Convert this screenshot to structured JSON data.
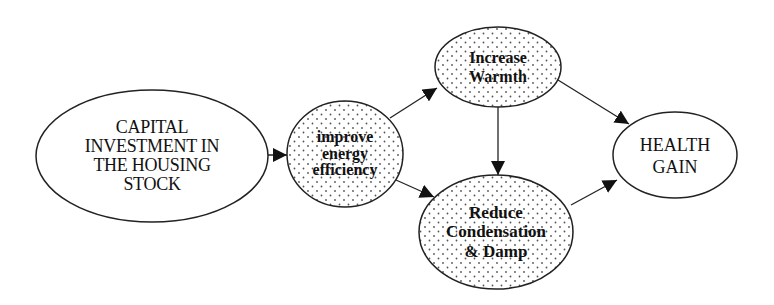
{
  "diagram": {
    "type": "causal-flow",
    "nodes": [
      {
        "id": "capital",
        "lines": [
          "CAPITAL",
          "INVESTMENT IN",
          "THE HOUSING",
          "STOCK"
        ],
        "fill": "plain"
      },
      {
        "id": "improve",
        "lines": [
          "improve",
          "energy",
          "efficiency"
        ],
        "fill": "dotted"
      },
      {
        "id": "warmth",
        "lines": [
          "Increase",
          "Warmth"
        ],
        "fill": "dotted"
      },
      {
        "id": "damp",
        "lines": [
          "Reduce",
          "Condensation",
          "& Damp"
        ],
        "fill": "dotted"
      },
      {
        "id": "health",
        "lines": [
          "HEALTH",
          "GAIN"
        ],
        "fill": "plain"
      }
    ],
    "edges": [
      {
        "from": "capital",
        "to": "improve"
      },
      {
        "from": "improve",
        "to": "warmth"
      },
      {
        "from": "improve",
        "to": "damp"
      },
      {
        "from": "warmth",
        "to": "damp"
      },
      {
        "from": "warmth",
        "to": "health"
      },
      {
        "from": "damp",
        "to": "health"
      }
    ],
    "colors": {
      "stroke": "#222222",
      "fill": "#ffffff",
      "dot": "#555555"
    }
  }
}
